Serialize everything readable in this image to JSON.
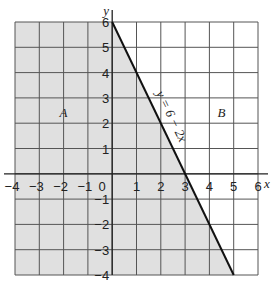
{
  "chart_data": {
    "type": "line",
    "title": "",
    "xlabel": "x",
    "ylabel": "y",
    "xlim": [
      -4,
      6
    ],
    "ylim": [
      -4,
      6
    ],
    "grid": true,
    "x_ticks": [
      "-4",
      "-3",
      "-2",
      "-1",
      "0",
      "1",
      "2",
      "3",
      "4",
      "5",
      "6"
    ],
    "y_ticks": [
      "-4",
      "-3",
      "-2",
      "-1",
      "1",
      "2",
      "3",
      "4",
      "5",
      "6"
    ],
    "series": [
      {
        "name": "y = 6 - 2x",
        "x": [
          0,
          5
        ],
        "y": [
          6,
          -4
        ]
      }
    ],
    "shaded_region": {
      "label": "A",
      "description": "region left of line y = 6 - 2x (y <= 6 - 2x)",
      "fill": "#e0e0e0"
    },
    "region_labels": [
      {
        "text": "A",
        "x": -2,
        "y": 2.4
      },
      {
        "text": "B",
        "x": 4.5,
        "y": 2.4
      }
    ],
    "annotations": [
      {
        "text": "y = 6 − 2x",
        "along_line": true
      }
    ]
  },
  "labels": {
    "x_axis": "x",
    "y_axis": "y",
    "line": "y = 6 − 2x",
    "region_a": "A",
    "region_b": "B",
    "origin": "0"
  }
}
